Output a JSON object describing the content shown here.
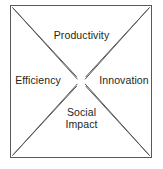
{
  "diagram": {
    "type": "bowtie-quadrant",
    "shape": "square-with-x-wedges",
    "background_color": "#ffffff",
    "line_color": "#58595b",
    "text_color": "#231f20",
    "border": {
      "left": 10,
      "top": 5,
      "right": 152,
      "bottom": 158
    },
    "quadrants": [
      {
        "position": "top",
        "label": "Productivity"
      },
      {
        "position": "left",
        "label": "Efficiency"
      },
      {
        "position": "right",
        "label": "Innovation"
      },
      {
        "position": "bottom",
        "label_line1": "Social",
        "label_line2": "Impact",
        "label": "Social Impact"
      }
    ],
    "labels": {
      "top": "Productivity",
      "left": "Efficiency",
      "right": "Innovation",
      "bottom_line1": "Social",
      "bottom_line2": "Impact"
    }
  }
}
